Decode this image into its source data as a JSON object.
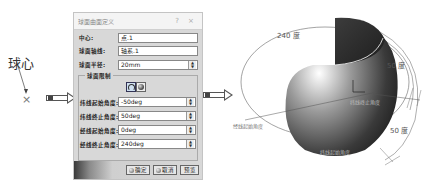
{
  "annotations": {
    "ball_center_label": "球心",
    "center_marker": "×"
  },
  "dialog": {
    "title": "球面曲面定义",
    "help_button": "?",
    "close_button": "×",
    "fields": {
      "center": {
        "label": "中心:",
        "value": "点.1"
      },
      "axis": {
        "label": "球面轴线:",
        "value": "轴系.1"
      },
      "radius": {
        "label": "球面半径:",
        "value": "20mm"
      }
    },
    "limits_group": {
      "title": "球面限制",
      "mode_buttons": [
        "limited-sphere-icon",
        "full-sphere-icon"
      ],
      "fields": [
        {
          "label": "纬线起始角度:",
          "value": "-50deg"
        },
        {
          "label": "纬线终止角度:",
          "value": "50deg"
        },
        {
          "label": "经线起始角度:",
          "value": "0deg"
        },
        {
          "label": "经线终止角度:",
          "value": "240deg"
        }
      ]
    },
    "buttons": {
      "ok": "确定",
      "cancel": "取消",
      "preview": "预览"
    }
  },
  "view3d": {
    "label_240": "240 度",
    "label_50_top": "50 度",
    "label_50_bottom": "50 度",
    "label_meridian_start": "经线起始角度",
    "label_meridian_end": "纬线终止角度",
    "label_lat_end": "纬线终止角度",
    "label_lat_start": "纬线起始角度",
    "axis_label": "L"
  }
}
